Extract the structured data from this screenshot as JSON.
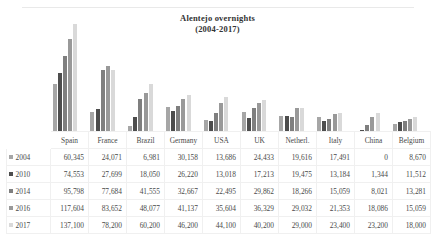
{
  "chart_data": {
    "type": "bar",
    "title": "Alentejo overnights",
    "subtitle": "(2004-2017)",
    "xlabel": "",
    "ylabel": "",
    "grid": false,
    "legend_position": "table-left",
    "categories": [
      "Spain",
      "France",
      "Brazil",
      "Germany",
      "USA",
      "UK",
      "Netherl.",
      "Italy",
      "China",
      "Belgium"
    ],
    "series": [
      {
        "name": "2004",
        "color": "#a6a6a6",
        "values": [
          60345,
          24071,
          6981,
          30158,
          13686,
          24433,
          19616,
          17491,
          0,
          8670
        ]
      },
      {
        "name": "2010",
        "color": "#4d4d4d",
        "values": [
          74553,
          27699,
          18050,
          26220,
          13018,
          17213,
          19475,
          13184,
          1344,
          11512
        ]
      },
      {
        "name": "2014",
        "color": "#7f7f7f",
        "values": [
          95798,
          77684,
          41555,
          32667,
          22495,
          29862,
          18266,
          15059,
          8021,
          13281
        ]
      },
      {
        "name": "2016",
        "color": "#999999",
        "values": [
          117604,
          83652,
          48077,
          41137,
          35604,
          36329,
          29032,
          21353,
          18086,
          15059
        ]
      },
      {
        "name": "2017",
        "color": "#d9d9d9",
        "values": [
          137100,
          78200,
          60200,
          46200,
          44100,
          40200,
          29000,
          23400,
          23200,
          18000
        ]
      }
    ],
    "ylim": [
      0,
      137100
    ],
    "display_values": [
      {
        "year": "2004",
        "cells": [
          "60,345",
          "24,071",
          "6,981",
          "30,158",
          "13,686",
          "24,433",
          "19,616",
          "17,491",
          "0",
          "8,670"
        ]
      },
      {
        "year": "2010",
        "cells": [
          "74,553",
          "27,699",
          "18,050",
          "26,220",
          "13,018",
          "17,213",
          "19,475",
          "13,184",
          "1,344",
          "11,512"
        ]
      },
      {
        "year": "2014",
        "cells": [
          "95,798",
          "77,684",
          "41,555",
          "32,667",
          "22,495",
          "29,862",
          "18,266",
          "15,059",
          "8,021",
          "13,281"
        ]
      },
      {
        "year": "2016",
        "cells": [
          "117,604",
          "83,652",
          "48,077",
          "41,137",
          "35,604",
          "36,329",
          "29,032",
          "21,353",
          "18,086",
          "15,059"
        ]
      },
      {
        "year": "2017",
        "cells": [
          "137,100",
          "78,200",
          "60,200",
          "46,200",
          "44,100",
          "40,200",
          "29,000",
          "23,400",
          "23,200",
          "18,000"
        ]
      }
    ]
  }
}
